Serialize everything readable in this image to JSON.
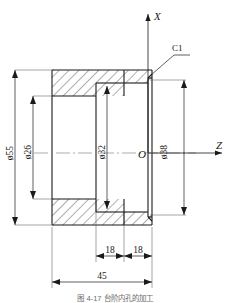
{
  "drawing": {
    "type": "mechanical-section-view",
    "title": "",
    "caption": "图 4-17  台阶内孔的加工",
    "axes": {
      "vertical_label": "X",
      "horizontal_label": "Z",
      "origin_label": "O"
    },
    "notes": [
      {
        "id": "chamfer-note",
        "label": "C1"
      }
    ],
    "dimensions": [
      {
        "id": "dia-55",
        "label": "ø55",
        "value": 55,
        "symbol": "ø",
        "orientation": "vertical",
        "position": "left-outer"
      },
      {
        "id": "dia-26",
        "label": "ø26",
        "value": 26,
        "symbol": "ø",
        "orientation": "vertical",
        "position": "left-inner"
      },
      {
        "id": "dia-32",
        "label": "ø32",
        "value": 32,
        "symbol": "ø",
        "orientation": "vertical",
        "position": "center"
      },
      {
        "id": "dia-38",
        "label": "ø38",
        "value": 38,
        "symbol": "ø",
        "orientation": "vertical",
        "position": "right"
      },
      {
        "id": "len-18-left",
        "label": "18",
        "value": 18,
        "orientation": "horizontal",
        "position": "bottom-left-chain"
      },
      {
        "id": "len-18-right",
        "label": "18",
        "value": 18,
        "orientation": "horizontal",
        "position": "bottom-right-chain"
      },
      {
        "id": "len-45",
        "label": "45",
        "value": 45,
        "orientation": "horizontal",
        "position": "bottom-overall"
      }
    ],
    "colors": {
      "line": "#1a1a1a",
      "thin_line": "#4a4a4a",
      "hatch": "#2a2a2a",
      "center_line": "#808080",
      "background": "#ffffff",
      "caption": "#6b6b6b"
    }
  }
}
